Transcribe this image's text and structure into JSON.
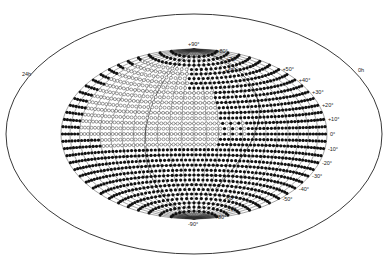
{
  "figure": {
    "projection": "Hammer-Aitoff all-sky equal-area",
    "center_x": 194,
    "center_y": 134,
    "semi_major": 188,
    "semi_minor": 120,
    "colors": {
      "grid": "#333333",
      "filled_dot": "#111111",
      "open_dot": "#555555",
      "background": "#ffffff"
    },
    "left_label": "24h",
    "right_label": "0h",
    "latitude_labels": [
      {
        "text": "+90°",
        "lat": 90
      },
      {
        "text": "+80°",
        "lat": 80
      },
      {
        "text": "+70°",
        "lat": 70
      },
      {
        "text": "+60°",
        "lat": 60
      },
      {
        "text": "+50°",
        "lat": 50
      },
      {
        "text": "+40°",
        "lat": 40
      },
      {
        "text": "+30°",
        "lat": 30
      },
      {
        "text": "+20°",
        "lat": 20
      },
      {
        "text": "+10°",
        "lat": 10
      },
      {
        "text": "0°",
        "lat": 0
      },
      {
        "text": "-10°",
        "lat": -10
      },
      {
        "text": "-20°",
        "lat": -20
      },
      {
        "text": "-30°",
        "lat": -30
      },
      {
        "text": "-40°",
        "lat": -40
      },
      {
        "text": "-50°",
        "lat": -50
      },
      {
        "text": "-60°",
        "lat": -60
      },
      {
        "text": "-70°",
        "lat": -70
      },
      {
        "text": "-80°",
        "lat": -80
      },
      {
        "text": "-90°",
        "lat": -90
      }
    ],
    "legend": {
      "filled": "observed / detected field (filled circle)",
      "open": "not detected field (open circle)"
    },
    "open_region_note": "Open circles cluster in the northern-western-central region roughly lat +60° to -10°, longitude left half; sparse open circles near the equator on the right"
  }
}
